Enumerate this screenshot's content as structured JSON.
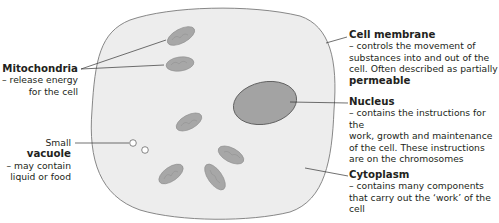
{
  "diagram": {
    "colors": {
      "cytoplasm_fill": "#ededed",
      "outline": "#7a7a7a",
      "organelle_fill": "#a7a7a7",
      "nucleus_fill": "#a3a3a3",
      "leader_line": "#333333",
      "text": "#231f20"
    },
    "labels": {
      "mitochondria": {
        "title": "Mitochondria",
        "line1": "– release energy",
        "line2": "for the cell"
      },
      "vacuole": {
        "prefix": "Small ",
        "title": "vacuole",
        "line1": "– may contain",
        "line2": "liquid or food"
      },
      "cell_membrane": {
        "title": "Cell membrane",
        "line1": "– controls the movement of",
        "line2": "substances into and out of the",
        "line3": "cell. Often described as partially",
        "line4_bold": "permeable"
      },
      "nucleus": {
        "title": "Nucleus",
        "line1": "– contains the instructions for the",
        "line2": "work, growth and maintenance",
        "line3": "of the cell. These instructions",
        "line4": "are on the chromosomes"
      },
      "cytoplasm": {
        "title": "Cytoplasm",
        "line1": "– contains many components",
        "line2": "that carry out the ‘work’ of the",
        "line3": "cell"
      }
    }
  }
}
